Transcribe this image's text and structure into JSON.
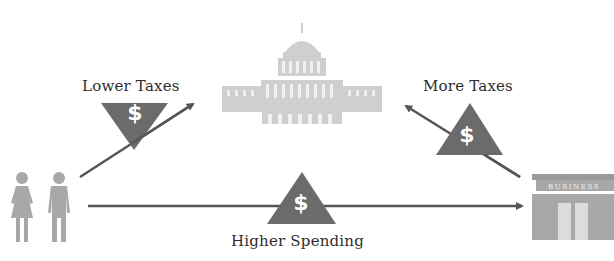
{
  "diagram": {
    "type": "economic-flow",
    "nodes": {
      "government": {
        "icon": "capitol-building-icon"
      },
      "households": {
        "icon": "people-icon"
      },
      "business": {
        "icon": "storefront-icon",
        "sign_text": "BUSINESS"
      }
    },
    "flows": [
      {
        "id": "lower_taxes",
        "label": "Lower Taxes",
        "from": "households",
        "to": "government",
        "badge_icon": "dollar-down-triangle-icon",
        "badge_text": "$"
      },
      {
        "id": "more_taxes",
        "label": "More Taxes",
        "from": "business",
        "to": "government",
        "badge_icon": "dollar-up-triangle-icon",
        "badge_text": "$"
      },
      {
        "id": "higher_spending",
        "label": "Higher Spending",
        "from": "households",
        "to": "business",
        "badge_icon": "dollar-up-triangle-icon",
        "badge_text": "$"
      }
    ],
    "colors": {
      "arrow": "#555555",
      "badge": "#6b6b6b",
      "icon": "#a8a8a8",
      "capitol": "#cfcfcf",
      "text": "#2e2e2e",
      "background": "#ffffff"
    }
  }
}
